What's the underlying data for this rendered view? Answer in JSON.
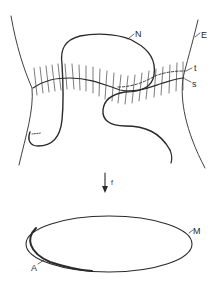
{
  "figure": {
    "upper": {
      "labels": {
        "N": "N",
        "E": "E",
        "t": "t",
        "s": "s"
      },
      "description": "Surface strip E bounded by two curves, with hatched band along curve s, dashed curve t, and closed loop N crossing the band"
    },
    "map": {
      "label": "f",
      "direction": "down"
    },
    "lower": {
      "labels": {
        "M": "M",
        "A": "A"
      },
      "description": "Ellipse M with thickened arc A"
    },
    "colors": {
      "stroke": "#2a2a2a",
      "background": "#ffffff"
    }
  }
}
